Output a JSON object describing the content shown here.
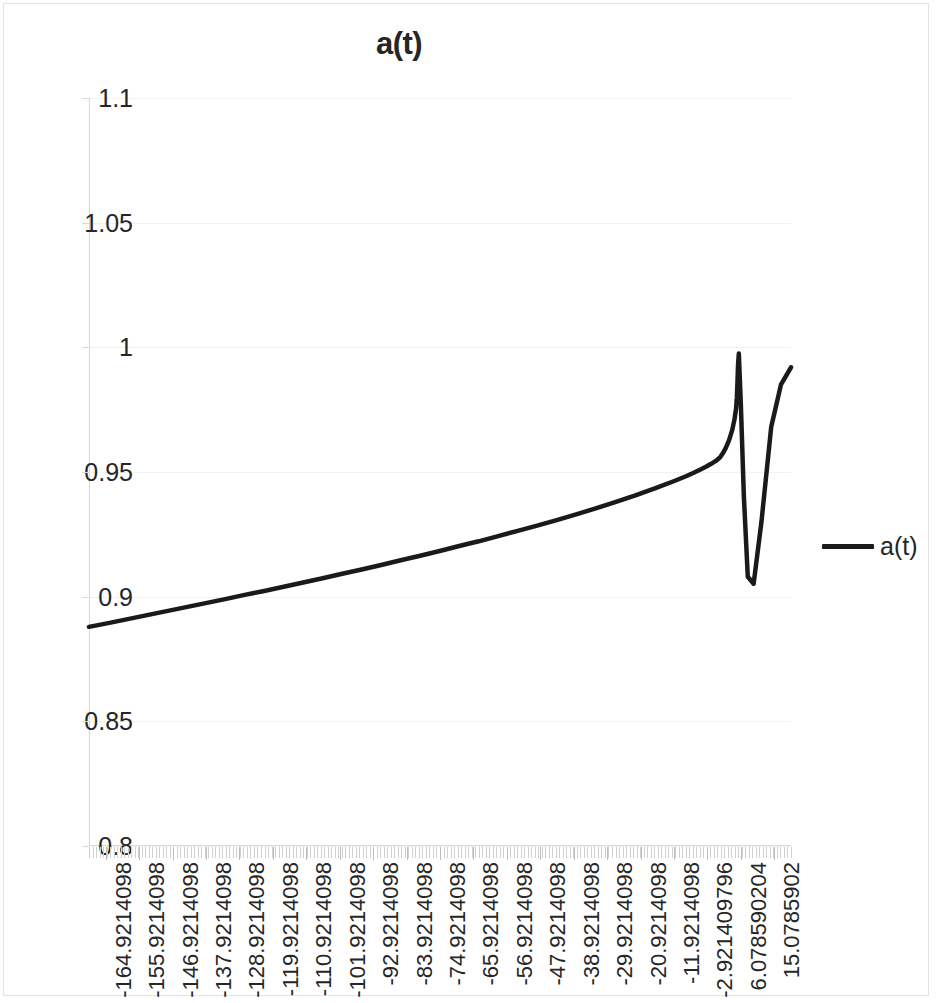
{
  "chart_data": {
    "type": "line",
    "title": "a(t)",
    "xlabel": "",
    "ylabel": "",
    "grid": true,
    "legend_position": "right",
    "legend_entries": [
      "a(t)"
    ],
    "ylim": [
      0.8,
      1.1
    ],
    "ytick_labels": [
      "1.1",
      "1.05",
      "1",
      "0.95",
      "0.9",
      "0.85",
      "0.8"
    ],
    "ytick_values": [
      1.1,
      1.05,
      1,
      0.95,
      0.9,
      0.85,
      0.8
    ],
    "xlim": [
      -164.9214098,
      15.0785902
    ],
    "xtick_labels": [
      "-164.9214098",
      "-155.9214098",
      "-146.9214098",
      "-137.9214098",
      "-128.9214098",
      "-119.9214098",
      "-110.9214098",
      "-101.9214098",
      "-92.9214098",
      "-83.9214098",
      "-74.9214098",
      "-65.9214098",
      "-56.9214098",
      "-47.9214098",
      "-38.9214098",
      "-29.9214098",
      "-20.9214098",
      "-11.9214098",
      "-2.921409796",
      "6.078590204",
      "15.0785902"
    ],
    "xtick_values": [
      -164.9214098,
      -155.9214098,
      -146.9214098,
      -137.9214098,
      -128.9214098,
      -119.9214098,
      -110.9214098,
      -101.9214098,
      -92.9214098,
      -83.9214098,
      -74.9214098,
      -65.9214098,
      -56.9214098,
      -47.9214098,
      -38.9214098,
      -29.9214098,
      -20.9214098,
      -11.9214098,
      -2.921409796,
      6.078590204,
      15.0785902
    ],
    "series": [
      {
        "name": "a(t)",
        "color": "#1a1a1a",
        "x": [
          -164.9214098,
          -160.0,
          -155.0,
          -150.0,
          -145.0,
          -140.0,
          -135.0,
          -130.0,
          -125.0,
          -120.0,
          -115.0,
          -110.0,
          -105.0,
          -100.0,
          -95.0,
          -90.0,
          -85.0,
          -80.0,
          -75.0,
          -70.0,
          -65.0,
          -60.0,
          -55.0,
          -50.0,
          -45.0,
          -40.0,
          -35.0,
          -30.0,
          -25.0,
          -20.0,
          -15.0,
          -12.0,
          -10.0,
          -8.0,
          -6.5,
          -5.5,
          -5.0,
          -4.6,
          -4.3,
          -4.1,
          -4.0,
          -3.9,
          -3.7,
          -3.4,
          -3.0,
          -2.4,
          -1.6,
          -0.8,
          0.0,
          0.6,
          1.0,
          1.2,
          1.35,
          1.5,
          1.7,
          2.2,
          3.0,
          4.0,
          5.5,
          7.5,
          10.0,
          12.5,
          15.0785902
        ],
        "y": [
          0.8879,
          0.8894,
          0.891,
          0.8926,
          0.8942,
          0.8958,
          0.8974,
          0.899,
          0.9007,
          0.9023,
          0.904,
          0.9057,
          0.9074,
          0.9092,
          0.9109,
          0.9127,
          0.9146,
          0.9164,
          0.9183,
          0.9203,
          0.9222,
          0.9243,
          0.9264,
          0.9285,
          0.9307,
          0.933,
          0.9354,
          0.9379,
          0.9405,
          0.9433,
          0.9463,
          0.9482,
          0.9496,
          0.9511,
          0.9523,
          0.9532,
          0.9537,
          0.9541,
          0.9544,
          0.9546,
          0.9547,
          0.9548,
          0.9551,
          0.9555,
          0.9561,
          0.9575,
          0.9598,
          0.9628,
          0.9668,
          0.9712,
          0.9755,
          0.98,
          0.986,
          0.993,
          0.9975,
          0.978,
          0.94,
          0.908,
          0.9052,
          0.93,
          0.968,
          0.985,
          0.992
        ]
      }
    ],
    "annotations": [
      {
        "type": "peak",
        "x": 1.7,
        "y": 0.9975,
        "note": "local maximum just below 1"
      },
      {
        "type": "trough",
        "x": 5.5,
        "y": 0.9052,
        "note": "sharp dip near 0.905"
      },
      {
        "type": "endpoint",
        "x": 15.0785902,
        "y": 0.992,
        "note": "recovery to ~0.992"
      }
    ]
  },
  "legend": {
    "label": "a(t)",
    "swatch_color": "#1a1a1a"
  },
  "title": {
    "text": "a(t)"
  }
}
